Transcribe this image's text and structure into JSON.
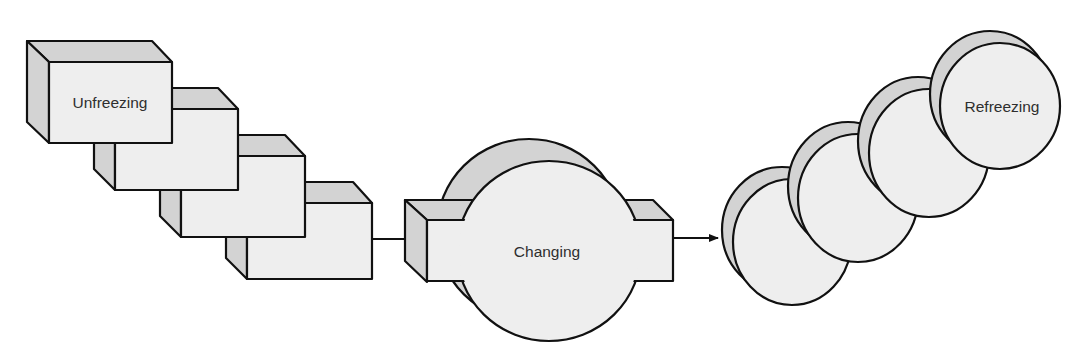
{
  "diagram": {
    "colors": {
      "front_face": "#eeeeee",
      "side_face": "#d3d3d3",
      "outline": "#111111",
      "text": "#2e2e2e",
      "background": "#ffffff"
    },
    "stages": [
      {
        "id": "unfreezing",
        "label": "Unfreezing",
        "shape": "stacked-boxes",
        "count": 4
      },
      {
        "id": "changing",
        "label": "Changing",
        "shape": "box-with-circle",
        "count": 1
      },
      {
        "id": "refreezing",
        "label": "Refreezing",
        "shape": "stacked-discs",
        "count": 4
      }
    ],
    "arrows": [
      {
        "from": "unfreezing",
        "to": "changing"
      },
      {
        "from": "changing",
        "to": "refreezing"
      }
    ]
  }
}
